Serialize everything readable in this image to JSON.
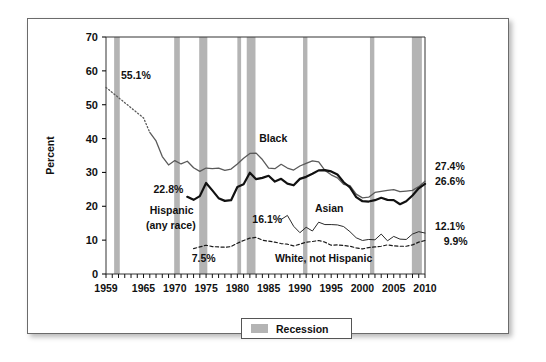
{
  "figure": {
    "y_axis_title": "Percent",
    "legend": {
      "items": [
        {
          "label": "Recession",
          "color": "#b4b4b4"
        }
      ]
    }
  },
  "chart_data": {
    "type": "line",
    "title": "",
    "xlabel": "",
    "ylabel": "Percent",
    "xlim": [
      1959,
      2010
    ],
    "ylim": [
      0,
      70
    ],
    "grid": false,
    "legend_position": "below-axes",
    "y_ticks": [
      0,
      10,
      20,
      30,
      40,
      50,
      60,
      70
    ],
    "y_tick_labels": [
      "0",
      "10",
      "20",
      "30",
      "40",
      "50",
      "60",
      "70"
    ],
    "x_ticks": [
      1959,
      1965,
      1970,
      1975,
      1980,
      1985,
      1990,
      1995,
      2000,
      2005,
      2010
    ],
    "x_tick_labels": [
      "1959",
      "1965",
      "1970",
      "1975",
      "1980",
      "1985",
      "1990",
      "1995",
      "2000",
      "2005",
      "2010"
    ],
    "x_minor_tick_interval": 1,
    "series": [
      {
        "name": "Black",
        "color": "#5a5a5a",
        "width": 1.3,
        "style": "solid-with-dotted-head",
        "dotted_until": 1966,
        "start_label": "55.1%",
        "end_label": "27.4%",
        "x": [
          1959,
          1960,
          1961,
          1962,
          1963,
          1964,
          1965,
          1966,
          1967,
          1968,
          1969,
          1970,
          1971,
          1972,
          1973,
          1974,
          1975,
          1976,
          1977,
          1978,
          1979,
          1980,
          1981,
          1982,
          1983,
          1984,
          1985,
          1986,
          1987,
          1988,
          1989,
          1990,
          1991,
          1992,
          1993,
          1994,
          1995,
          1996,
          1997,
          1998,
          1999,
          2000,
          2001,
          2002,
          2003,
          2004,
          2005,
          2006,
          2007,
          2008,
          2009,
          2010
        ],
        "values": [
          55.1,
          53.6,
          52.1,
          50.6,
          49.1,
          47.6,
          46.1,
          41.8,
          39.3,
          34.7,
          32.2,
          33.5,
          32.5,
          33.3,
          31.4,
          30.3,
          31.3,
          31.1,
          31.3,
          30.6,
          31.0,
          32.5,
          34.2,
          35.6,
          35.7,
          33.8,
          31.3,
          31.1,
          32.4,
          31.3,
          30.7,
          31.9,
          32.7,
          33.4,
          33.1,
          30.6,
          29.3,
          28.4,
          26.5,
          26.1,
          23.6,
          22.5,
          22.7,
          24.1,
          24.4,
          24.7,
          24.9,
          24.3,
          24.5,
          24.7,
          25.8,
          27.4
        ]
      },
      {
        "name": "Hispanic (any race)",
        "color": "#111111",
        "width": 2.2,
        "style": "solid",
        "start_label": "22.8%",
        "end_label": "26.6%",
        "x": [
          1972,
          1973,
          1974,
          1975,
          1976,
          1977,
          1978,
          1979,
          1980,
          1981,
          1982,
          1983,
          1984,
          1985,
          1986,
          1987,
          1988,
          1989,
          1990,
          1991,
          1992,
          1993,
          1994,
          1995,
          1996,
          1997,
          1998,
          1999,
          2000,
          2001,
          2002,
          2003,
          2004,
          2005,
          2006,
          2007,
          2008,
          2009,
          2010
        ],
        "values": [
          22.8,
          21.9,
          23.0,
          26.9,
          24.7,
          22.4,
          21.6,
          21.8,
          25.7,
          26.5,
          29.9,
          28.0,
          28.4,
          29.0,
          27.3,
          28.1,
          26.7,
          26.2,
          28.1,
          28.7,
          29.6,
          30.6,
          30.7,
          30.3,
          29.4,
          27.1,
          25.6,
          22.7,
          21.5,
          21.4,
          21.8,
          22.5,
          21.9,
          21.8,
          20.6,
          21.5,
          23.2,
          25.3,
          26.6
        ]
      },
      {
        "name": "Asian",
        "color": "#2a2a2a",
        "width": 1.0,
        "style": "solid",
        "start_label": "16.1%",
        "end_label": "12.1%",
        "x": [
          1987,
          1988,
          1989,
          1990,
          1991,
          1992,
          1993,
          1994,
          1995,
          1996,
          1997,
          1998,
          1999,
          2000,
          2001,
          2002,
          2003,
          2004,
          2005,
          2006,
          2007,
          2008,
          2009,
          2010
        ],
        "values": [
          16.1,
          17.3,
          14.1,
          12.2,
          13.8,
          12.7,
          15.3,
          14.6,
          14.6,
          14.5,
          14.0,
          12.5,
          10.7,
          9.9,
          10.2,
          10.1,
          11.8,
          9.8,
          11.1,
          10.3,
          10.2,
          11.8,
          12.5,
          12.1
        ]
      },
      {
        "name": "White, not Hispanic",
        "color": "#1a1a1a",
        "width": 1.2,
        "style": "dashed",
        "start_label": "7.5%",
        "end_label": "9.9%",
        "x": [
          1973,
          1974,
          1975,
          1976,
          1977,
          1978,
          1979,
          1980,
          1981,
          1982,
          1983,
          1984,
          1985,
          1986,
          1987,
          1988,
          1989,
          1990,
          1991,
          1992,
          1993,
          1994,
          1995,
          1996,
          1997,
          1998,
          1999,
          2000,
          2001,
          2002,
          2003,
          2004,
          2005,
          2006,
          2007,
          2008,
          2009,
          2010
        ],
        "values": [
          7.5,
          8.0,
          8.5,
          8.1,
          8.0,
          7.9,
          8.1,
          9.1,
          9.9,
          10.6,
          10.8,
          10.0,
          9.7,
          9.4,
          9.0,
          8.8,
          8.3,
          8.8,
          9.4,
          9.6,
          9.9,
          9.4,
          8.5,
          8.6,
          8.4,
          8.2,
          7.7,
          7.4,
          7.8,
          8.0,
          8.2,
          8.6,
          8.3,
          8.2,
          8.2,
          8.6,
          9.4,
          9.9
        ]
      }
    ],
    "annotations": [
      {
        "id": "black-start",
        "text": "55.1%",
        "x": 1961.4,
        "y": 57.5,
        "anchor": "start"
      },
      {
        "id": "black-series",
        "text": "Black",
        "x": 1983.5,
        "y": 39.0,
        "anchor": "start"
      },
      {
        "id": "hispanic-start",
        "text": "22.8%",
        "x": 1966.6,
        "y": 24.0,
        "anchor": "start"
      },
      {
        "id": "hispanic-series-line1",
        "text": "Hispanic",
        "x": 1966.0,
        "y": 17.6,
        "anchor": "start"
      },
      {
        "id": "hispanic-series-line2",
        "text": "(any race)",
        "x": 1965.4,
        "y": 13.3,
        "anchor": "start"
      },
      {
        "id": "asian-start",
        "text": "16.1%",
        "x": 1982.4,
        "y": 15.0,
        "anchor": "start"
      },
      {
        "id": "asian-series",
        "text": "Asian",
        "x": 1992.4,
        "y": 18.2,
        "anchor": "start"
      },
      {
        "id": "white-start",
        "text": "7.5%",
        "x": 1972.7,
        "y": 3.6,
        "anchor": "start"
      },
      {
        "id": "white-series",
        "text": "White, not Hispanic",
        "x": 1986.0,
        "y": 3.6,
        "anchor": "start"
      },
      {
        "id": "black-end",
        "text": "27.4%",
        "x": 2011.6,
        "y": 30.6,
        "anchor": "start"
      },
      {
        "id": "hispanic-end",
        "text": "26.6%",
        "x": 2011.6,
        "y": 26.3,
        "anchor": "start"
      },
      {
        "id": "asian-end",
        "text": "12.1%",
        "x": 2011.6,
        "y": 13.1,
        "anchor": "start"
      },
      {
        "id": "white-end",
        "text": "9.9%",
        "x": 2013.0,
        "y": 8.6,
        "anchor": "start"
      }
    ],
    "recessions": [
      {
        "start": 1960.3,
        "end": 1961.2
      },
      {
        "start": 1969.9,
        "end": 1970.8
      },
      {
        "start": 1973.9,
        "end": 1975.2
      },
      {
        "start": 1980.0,
        "end": 1980.6
      },
      {
        "start": 1981.5,
        "end": 1982.9
      },
      {
        "start": 1990.5,
        "end": 1991.2
      },
      {
        "start": 2001.2,
        "end": 2001.9
      },
      {
        "start": 2007.9,
        "end": 2009.5
      }
    ],
    "recession_color": "#b4b4b4"
  }
}
